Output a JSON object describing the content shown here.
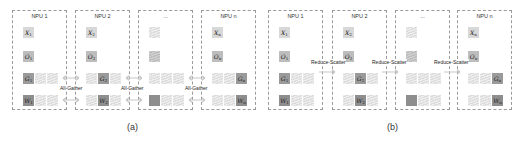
{
  "panels": [
    {
      "caption": "(a)",
      "operation": "All-Gather",
      "npus": [
        {
          "title": "NPU 1",
          "x_label": "X",
          "x_sub": "1",
          "o_label": "O",
          "o_sub": "1",
          "g_label": "G",
          "g_sub": "1",
          "w_label": "W",
          "w_sub": "1"
        },
        {
          "title": "NPU 2",
          "x_label": "X",
          "x_sub": "2",
          "o_label": "O",
          "o_sub": "2",
          "g_label": "G",
          "g_sub": "2",
          "w_label": "W",
          "w_sub": "2"
        },
        {
          "title": "...",
          "x_label": "",
          "o_label": "",
          "g_label": "",
          "w_label": ""
        },
        {
          "title": "NPU n",
          "x_label": "X",
          "x_sub": "n",
          "o_label": "O",
          "o_sub": "n",
          "g_label": "G",
          "g_sub": "n",
          "w_label": "W",
          "w_sub": "n"
        }
      ],
      "arrow_labels": [
        "All-Gather",
        "All-Gather",
        "All-Gather"
      ]
    },
    {
      "caption": "(b)",
      "operation": "Reduce-Scatter",
      "npus": [
        {
          "title": "NPU 1",
          "x_label": "X",
          "x_sub": "1",
          "o_label": "O",
          "o_sub": "1",
          "g_label": "G",
          "g_sub": "1",
          "w_label": "W",
          "w_sub": "1"
        },
        {
          "title": "NPU 2",
          "x_label": "X",
          "x_sub": "2",
          "o_label": "O",
          "o_sub": "2",
          "g_label": "G",
          "g_sub": "2",
          "w_label": "W",
          "w_sub": "2"
        },
        {
          "title": "...",
          "x_label": "",
          "o_label": "",
          "g_label": "",
          "w_label": ""
        },
        {
          "title": "NPU n",
          "x_label": "X",
          "x_sub": "n",
          "o_label": "O",
          "o_sub": "n",
          "g_label": "G",
          "g_sub": "n",
          "w_label": "W",
          "w_sub": "n"
        }
      ],
      "arrow_labels": [
        "Reduce-Scatter",
        "Reduce-Scatter",
        "Reduce-Scatter"
      ]
    }
  ],
  "colors": {
    "box_border": "#9a9a9a",
    "x_block": "#d8d8d8",
    "o_block": "#bdbdbd",
    "g_block": "#9a9a9a",
    "w_block": "#8e8e8e",
    "hatched": "#e4e4e4",
    "arrow": "#c8c8c8"
  }
}
